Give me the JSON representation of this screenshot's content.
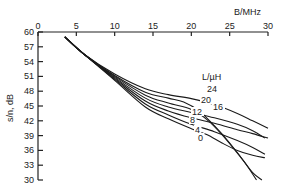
{
  "chart_data": {
    "type": "line",
    "title": "",
    "xlabel": "B/MHz",
    "ylabel": "s/n, dB",
    "xlim": [
      0,
      30
    ],
    "ylim": [
      30,
      60
    ],
    "x_ticks": [
      "0",
      "5",
      "10",
      "15",
      "20",
      "25",
      "30"
    ],
    "y_ticks": [
      "60",
      "57",
      "54",
      "51",
      "48",
      "45",
      "42",
      "39",
      "36",
      "33",
      "30"
    ],
    "x_axis_position": "top",
    "grid": false,
    "legend_title": "L/µH",
    "legend_position": "inline labels on curves",
    "series": [
      {
        "name": "24",
        "points": [
          [
            3.5,
            59
          ],
          [
            6,
            55.5
          ],
          [
            10,
            51.5
          ],
          [
            14,
            48.5
          ],
          [
            17,
            47.3
          ],
          [
            20,
            46.5
          ],
          [
            23,
            45.3
          ],
          [
            26,
            43.5
          ],
          [
            28,
            42
          ],
          [
            30,
            40.5
          ]
        ]
      },
      {
        "name": "20",
        "points": [
          [
            3.5,
            59
          ],
          [
            6,
            55.5
          ],
          [
            10,
            51.2
          ],
          [
            14,
            47.8
          ],
          [
            17,
            46.6
          ],
          [
            19,
            45.8
          ],
          [
            21,
            44
          ],
          [
            23,
            41
          ],
          [
            25,
            37.5
          ],
          [
            27,
            33.5
          ],
          [
            28.5,
            30
          ]
        ]
      },
      {
        "name": "16",
        "points": [
          [
            3.5,
            59
          ],
          [
            6,
            55.5
          ],
          [
            10,
            51
          ],
          [
            14,
            47.2
          ],
          [
            17,
            45.6
          ],
          [
            20,
            44.3
          ],
          [
            22,
            42.3
          ],
          [
            24,
            39.2
          ],
          [
            26.5,
            34.5
          ],
          [
            28,
            31.5
          ],
          [
            29.2,
            30
          ]
        ]
      },
      {
        "name": "12",
        "points": [
          [
            3.5,
            59
          ],
          [
            6,
            55.5
          ],
          [
            10,
            50.8
          ],
          [
            14,
            46.6
          ],
          [
            17,
            44.8
          ],
          [
            20,
            43.7
          ],
          [
            23,
            42.6
          ],
          [
            26,
            41.3
          ],
          [
            28,
            40
          ],
          [
            29.6,
            38.5
          ]
        ]
      },
      {
        "name": "8",
        "points": [
          [
            3.5,
            59
          ],
          [
            6,
            55.5
          ],
          [
            10,
            50.6
          ],
          [
            14,
            46
          ],
          [
            17,
            44
          ],
          [
            20,
            42.6
          ],
          [
            23,
            41.5
          ],
          [
            26,
            40.2
          ],
          [
            28,
            39.4
          ],
          [
            30,
            38.5
          ]
        ]
      },
      {
        "name": "4",
        "points": [
          [
            3.5,
            59
          ],
          [
            6,
            55.5
          ],
          [
            10,
            50.4
          ],
          [
            14,
            45.4
          ],
          [
            17,
            43.2
          ],
          [
            20,
            41.3
          ],
          [
            23,
            39.8
          ],
          [
            26,
            38
          ],
          [
            28,
            36.6
          ],
          [
            29.6,
            35.2
          ]
        ]
      },
      {
        "name": "0",
        "points": [
          [
            3.5,
            59
          ],
          [
            6,
            55.5
          ],
          [
            10,
            50.2
          ],
          [
            14,
            44.8
          ],
          [
            17,
            42.4
          ],
          [
            20,
            40.4
          ],
          [
            22,
            39.2
          ],
          [
            24,
            37.5
          ],
          [
            26,
            36
          ],
          [
            28,
            35
          ],
          [
            29.6,
            34.5
          ]
        ]
      }
    ]
  }
}
